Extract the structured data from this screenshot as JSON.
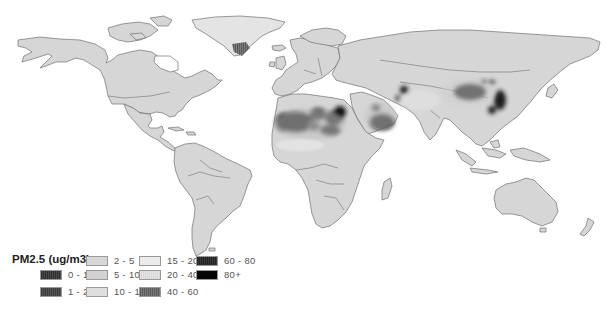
{
  "legend": {
    "title": "PM2.5 (ug/m3)",
    "items": [
      {
        "label": "0 - 1",
        "color": "#3a3a3a",
        "pattern": "hatch-dark"
      },
      {
        "label": "1 - 2",
        "color": "#4a4a4a",
        "pattern": "hatch-dark"
      },
      {
        "label": "2 - 5",
        "color": "#d8d8d8",
        "pattern": "solid"
      },
      {
        "label": "5 - 10",
        "color": "#d2d2d2",
        "pattern": "solid"
      },
      {
        "label": "10 - 15",
        "color": "#dedede",
        "pattern": "solid"
      },
      {
        "label": "15 - 20",
        "color": "#ececec",
        "pattern": "solid"
      },
      {
        "label": "20 - 40",
        "color": "#e2e2e2",
        "pattern": "hatch-light"
      },
      {
        "label": "40 - 60",
        "color": "#6a6a6a",
        "pattern": "hatch-mid"
      },
      {
        "label": "60 - 80",
        "color": "#2e2e2e",
        "pattern": "hatch-dark"
      },
      {
        "label": "80+",
        "color": "#050505",
        "pattern": "solid"
      }
    ]
  },
  "colors": {
    "ocean": "#ffffff",
    "land_base": "#d6d6d6",
    "border": "#6e6e6e",
    "hotspot": "#111111"
  },
  "hotspots": [
    {
      "region": "Sahara (western)",
      "level": "80+"
    },
    {
      "region": "Sahara (central/Libya)",
      "level": "60 - 80"
    },
    {
      "region": "Arabian Peninsula",
      "level": "80+"
    },
    {
      "region": "Taklamakan Desert",
      "level": "80+"
    },
    {
      "region": "Eastern China",
      "level": "60 - 80"
    },
    {
      "region": "Turkmenistan/Aral",
      "level": "40 - 60"
    }
  ]
}
